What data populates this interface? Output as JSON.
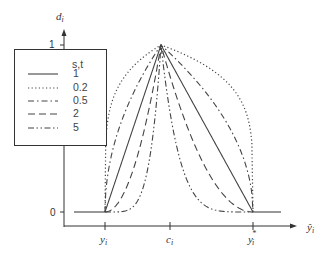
{
  "chart_data": {
    "type": "line",
    "title": "",
    "xlabel": "ŷ_i",
    "ylabel": "d_i",
    "x_ticks": [
      {
        "label": "y_i",
        "pos": 0
      },
      {
        "label": "c_i",
        "pos": 1
      },
      {
        "label": "y_i*",
        "pos": 2
      }
    ],
    "y_ticks": [
      {
        "label": "0",
        "value": 0
      },
      {
        "label": "1",
        "value": 1
      }
    ],
    "ylim": [
      0,
      1
    ],
    "grid": false,
    "legend": {
      "title": "s,t",
      "position": "upper-left",
      "entries": [
        {
          "label": "1",
          "style": "solid"
        },
        {
          "label": "0.2",
          "style": "dotted"
        },
        {
          "label": "0.5",
          "style": "dash-dot"
        },
        {
          "label": "2",
          "style": "dashed"
        },
        {
          "label": "5",
          "style": "dash-dot-dot"
        }
      ]
    },
    "series": [
      {
        "name": "1",
        "exponent": 1,
        "style": "solid"
      },
      {
        "name": "0.2",
        "exponent": 0.2,
        "style": "dotted"
      },
      {
        "name": "0.5",
        "exponent": 0.5,
        "style": "dash-dot"
      },
      {
        "name": "2",
        "exponent": 2,
        "style": "dashed"
      },
      {
        "name": "5",
        "exponent": 5,
        "style": "dash-dot-dot"
      }
    ]
  },
  "labels": {
    "y_axis": "d",
    "y_axis_sub": "i",
    "x_axis": "ŷ",
    "x_axis_sub": "i",
    "tick_zero": "0",
    "tick_one": "1",
    "x_tick_low": "y",
    "x_tick_low_sub": "i",
    "x_tick_mid": "c",
    "x_tick_mid_sub": "i",
    "x_tick_high": "y",
    "x_tick_high_sub": "i",
    "x_tick_high_sup": "*",
    "legend_title": "s,t",
    "legend_items": [
      "1",
      "0.2",
      "0.5",
      "2",
      "5"
    ]
  }
}
